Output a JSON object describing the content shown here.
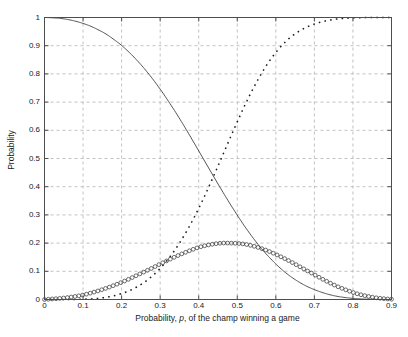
{
  "chart_data": {
    "type": "line",
    "title": "",
    "xlabel_parts": {
      "pre": "Probability, ",
      "italic": "p",
      "post": ", of the  champ winning a game"
    },
    "xlabel": "Probability, p, of the  champ winning a game",
    "ylabel": "Probability",
    "xlim": [
      0,
      0.9
    ],
    "ylim": [
      0,
      1
    ],
    "grid": true,
    "grid_style": "dashed",
    "legend": null,
    "xticks": [
      "0",
      "0.1",
      "0.2",
      "0.3",
      "0.4",
      "0.5",
      "0.6",
      "0.7",
      "0.8",
      "0.9"
    ],
    "xtick_values": [
      0,
      0.1,
      0.2,
      0.3,
      0.4,
      0.5,
      0.6,
      0.7,
      0.8,
      0.9
    ],
    "yticks": [
      "0",
      "0.1",
      "0.2",
      "0.3",
      "0.4",
      "0.5",
      "0.6",
      "0.7",
      "0.8",
      "0.9",
      "1"
    ],
    "ytick_values": [
      0,
      0.1,
      0.2,
      0.3,
      0.4,
      0.5,
      0.6,
      0.7,
      0.8,
      0.9,
      1
    ],
    "x": [
      0,
      0.02,
      0.04,
      0.06,
      0.08,
      0.1,
      0.12,
      0.14,
      0.16,
      0.18,
      0.2,
      0.22,
      0.24,
      0.26,
      0.28,
      0.3,
      0.32,
      0.34,
      0.36,
      0.38,
      0.4,
      0.42,
      0.44,
      0.46,
      0.48,
      0.5,
      0.52,
      0.54,
      0.56,
      0.58,
      0.6,
      0.62,
      0.64,
      0.66,
      0.68,
      0.7,
      0.72,
      0.74,
      0.76,
      0.78,
      0.8,
      0.82,
      0.84,
      0.86,
      0.88,
      0.9
    ],
    "series": [
      {
        "name": "solid-curve",
        "style": "solid",
        "color": "#404040",
        "marker": "none",
        "values": [
          1.0,
          0.999,
          0.997,
          0.993,
          0.987,
          0.979,
          0.969,
          0.956,
          0.941,
          0.922,
          0.901,
          0.876,
          0.848,
          0.817,
          0.783,
          0.746,
          0.706,
          0.664,
          0.62,
          0.574,
          0.527,
          0.48,
          0.433,
          0.387,
          0.342,
          0.299,
          0.258,
          0.22,
          0.185,
          0.154,
          0.126,
          0.101,
          0.08,
          0.062,
          0.047,
          0.035,
          0.025,
          0.017,
          0.011,
          0.007,
          0.004,
          0.002,
          0.001,
          0.0005,
          0.0002,
          0.0
        ]
      },
      {
        "name": "dotted-curve",
        "style": "dotted",
        "color": "#1a1a1a",
        "marker": "dot",
        "values": [
          0.0,
          0.0,
          0.0,
          0.0,
          0.0,
          0.001,
          0.002,
          0.004,
          0.008,
          0.013,
          0.021,
          0.031,
          0.045,
          0.062,
          0.084,
          0.11,
          0.142,
          0.179,
          0.222,
          0.27,
          0.323,
          0.381,
          0.442,
          0.505,
          0.568,
          0.63,
          0.69,
          0.745,
          0.795,
          0.839,
          0.876,
          0.907,
          0.932,
          0.951,
          0.966,
          0.977,
          0.985,
          0.991,
          0.995,
          0.997,
          0.999,
          0.999,
          1.0,
          1.0,
          1.0,
          1.0
        ]
      },
      {
        "name": "circle-marker-curve",
        "style": "markers",
        "color": "#303030",
        "marker": "circle",
        "values": [
          0.0,
          0.002,
          0.004,
          0.007,
          0.011,
          0.016,
          0.023,
          0.031,
          0.04,
          0.05,
          0.061,
          0.073,
          0.086,
          0.099,
          0.112,
          0.126,
          0.139,
          0.152,
          0.164,
          0.175,
          0.185,
          0.192,
          0.197,
          0.2,
          0.2,
          0.199,
          0.196,
          0.19,
          0.182,
          0.172,
          0.16,
          0.147,
          0.133,
          0.118,
          0.103,
          0.088,
          0.073,
          0.059,
          0.046,
          0.035,
          0.025,
          0.017,
          0.011,
          0.006,
          0.003,
          0.001
        ]
      }
    ],
    "axes": {
      "background": "#ffffff",
      "border_color": "#4d4d4d",
      "grid_color": "#b3b3b3"
    }
  }
}
